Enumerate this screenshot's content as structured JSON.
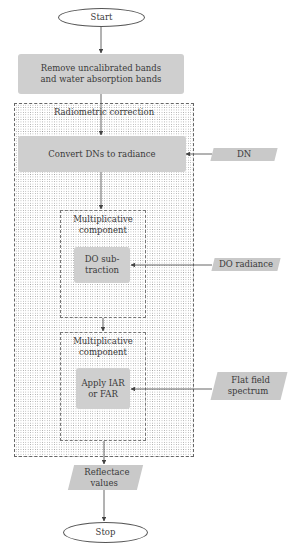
{
  "diagram": {
    "type": "flowchart",
    "nodes": {
      "start": "Start",
      "remove": "Remove uncalibrated bands and water absorption bands",
      "remove_line1": "Remove uncalibrated bands",
      "remove_line2": "and water absorption bands",
      "radiometric_group": "Radiometric correction",
      "convert": "Convert DNs to radiance",
      "dn_input": "DN",
      "mult1_line1": "Multiplicative",
      "mult1_line2": "component",
      "do_line1": "DO sub-",
      "do_line2": "traction",
      "do_radiance": "DO radiance",
      "mult2_line1": "Multiplicative",
      "mult2_line2": "component",
      "apply_line1": "Apply IAR",
      "apply_line2": "or FAR",
      "flat_line1": "Flat field",
      "flat_line2": "spectrum",
      "refl_line1": "Reflectace",
      "refl_line2": "values",
      "stop": "Stop"
    },
    "edges": [
      [
        "Start",
        "Remove uncalibrated bands and water absorption bands"
      ],
      [
        "Remove uncalibrated bands and water absorption bands",
        "Convert DNs to radiance"
      ],
      [
        "DN",
        "Convert DNs to radiance"
      ],
      [
        "Convert DNs to radiance",
        "Multiplicative component"
      ],
      [
        "DO radiance",
        "DO subtraction"
      ],
      [
        "Multiplicative component",
        "Multiplicative component (2)"
      ],
      [
        "Flat field spectrum",
        "Apply IAR or FAR"
      ],
      [
        "Radiometric correction",
        "Reflectace values"
      ],
      [
        "Reflectace values",
        "Stop"
      ]
    ]
  }
}
